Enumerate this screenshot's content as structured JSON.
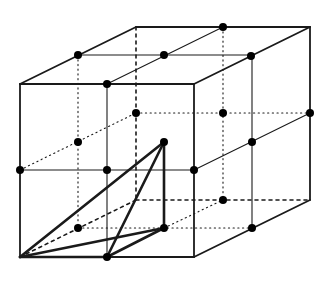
{
  "diagram": {
    "type": "cube-lattice-with-tetrahedron",
    "colors": {
      "line": "#1a1a1a",
      "background": "#ffffff",
      "point": "#000000"
    },
    "cube": {
      "front_face": [
        [
          20,
          84
        ],
        [
          194,
          84
        ],
        [
          194,
          257
        ],
        [
          20,
          257
        ]
      ],
      "back_corners": {
        "top_left": [
          136,
          27
        ],
        "top_right": [
          310,
          27
        ],
        "bottom_right": [
          310,
          200
        ],
        "bottom_left": [
          136,
          200
        ]
      }
    },
    "visible_edges": [
      [
        20,
        84,
        194,
        84
      ],
      [
        194,
        84,
        194,
        257
      ],
      [
        194,
        257,
        20,
        257
      ],
      [
        20,
        257,
        20,
        84
      ],
      [
        20,
        84,
        136,
        27
      ],
      [
        136,
        27,
        310,
        27
      ],
      [
        310,
        27,
        194,
        84
      ],
      [
        310,
        27,
        310,
        200
      ],
      [
        310,
        200,
        194,
        257
      ]
    ],
    "visible_midlines": [
      [
        107,
        84,
        107,
        257
      ],
      [
        20,
        170,
        194,
        170
      ],
      [
        78,
        55,
        251,
        55
      ],
      [
        107,
        84,
        223,
        27
      ],
      [
        252,
        56,
        252,
        228
      ],
      [
        194,
        170,
        310,
        113
      ]
    ],
    "hidden_dashed_edges": [
      [
        136,
        27,
        136,
        200
      ],
      [
        136,
        200,
        310,
        200
      ],
      [
        20,
        257,
        136,
        200
      ]
    ],
    "hidden_dotted_lines": [
      [
        78,
        55,
        78,
        228
      ],
      [
        223,
        27,
        223,
        200
      ],
      [
        136,
        113,
        310,
        113
      ],
      [
        78,
        228,
        252,
        228
      ],
      [
        20,
        170,
        136,
        113
      ],
      [
        164,
        228,
        223,
        200
      ]
    ],
    "tetrahedron": {
      "vertices": {
        "A": [
          20,
          257
        ],
        "B": [
          107,
          257
        ],
        "C": [
          164,
          228
        ],
        "D": [
          164,
          142
        ]
      },
      "edges": [
        [
          "A",
          "B"
        ],
        [
          "A",
          "C"
        ],
        [
          "A",
          "D"
        ],
        [
          "B",
          "C"
        ],
        [
          "B",
          "D"
        ],
        [
          "C",
          "D"
        ]
      ]
    },
    "points": [
      [
        78,
        55
      ],
      [
        164,
        55
      ],
      [
        223,
        27
      ],
      [
        251,
        56
      ],
      [
        107,
        84
      ],
      [
        136,
        113
      ],
      [
        223,
        113
      ],
      [
        310,
        113
      ],
      [
        78,
        142
      ],
      [
        164,
        142
      ],
      [
        252,
        142
      ],
      [
        20,
        170
      ],
      [
        107,
        170
      ],
      [
        194,
        170
      ],
      [
        223,
        200
      ],
      [
        78,
        228
      ],
      [
        164,
        228
      ],
      [
        252,
        228
      ],
      [
        107,
        257
      ]
    ]
  }
}
